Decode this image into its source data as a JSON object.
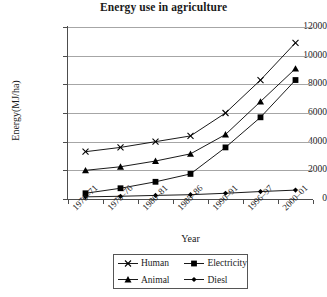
{
  "chart_data": {
    "type": "line",
    "title": "Energy use in agriculture",
    "xlabel": "Year",
    "ylabel": "Energy(MJ/ha)",
    "categories": [
      "1970–71",
      "1975–76",
      "1980–81",
      "1985–86",
      "1990–91",
      "1996–97",
      "2000–01"
    ],
    "ylim": [
      0,
      12000
    ],
    "ytick_labels": [
      "0",
      "2000",
      "4000",
      "6000",
      "8000",
      "10000",
      "12000"
    ],
    "ytick_values": [
      0,
      2000,
      4000,
      6000,
      8000,
      10000,
      12000
    ],
    "grid": true,
    "legend_position": "bottom",
    "series": [
      {
        "name": "Human",
        "marker": "x-cross",
        "color": "#000000",
        "values": [
          3300,
          3600,
          4000,
          4400,
          6000,
          8300,
          10900
        ]
      },
      {
        "name": "Electricity",
        "marker": "square",
        "color": "#000000",
        "values": [
          400,
          750,
          1200,
          1750,
          3600,
          5700,
          8300
        ]
      },
      {
        "name": "Animal",
        "marker": "triangle",
        "color": "#000000",
        "values": [
          2000,
          2250,
          2650,
          3150,
          4500,
          6800,
          9100
        ]
      },
      {
        "name": "Diesl",
        "marker": "diamond",
        "color": "#000000",
        "values": [
          150,
          190,
          250,
          300,
          400,
          520,
          620
        ]
      }
    ]
  }
}
